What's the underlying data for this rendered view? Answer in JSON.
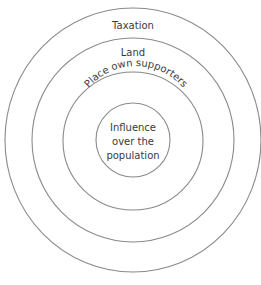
{
  "diagram": {
    "type": "concentric-circles",
    "rings": [
      {
        "label": "Taxation"
      },
      {
        "label": "Land"
      },
      {
        "label": "Place own supporters"
      },
      {
        "label_lines": [
          "Influence",
          "over the",
          "population"
        ]
      }
    ],
    "colors": {
      "stroke": "#8a8a8a",
      "text": "#3a3a3a",
      "background": "#ffffff"
    }
  }
}
